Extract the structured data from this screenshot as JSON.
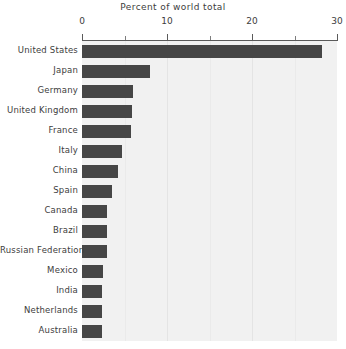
{
  "chart_data": {
    "type": "bar",
    "orientation": "horizontal",
    "title": "Percent of world total",
    "xlabel": "",
    "ylabel": "",
    "xlim": [
      0,
      30
    ],
    "xticks": [
      0,
      10,
      20,
      30
    ],
    "xtick_labels": [
      "0",
      "10",
      "20",
      "30"
    ],
    "minor_xticks": [
      5,
      15,
      25
    ],
    "grid": true,
    "grid_axis": "x",
    "legend": false,
    "bar_color": "#464646",
    "plot_background": "#f1f1f1",
    "categories": [
      "United States",
      "Japan",
      "Germany",
      "United Kingdom",
      "France",
      "Italy",
      "China",
      "Spain",
      "Canada",
      "Brazil",
      "Russian Federation",
      "Mexico",
      "India",
      "Netherlands",
      "Australia"
    ],
    "values": [
      28.2,
      8.0,
      6.0,
      5.9,
      5.8,
      4.7,
      4.2,
      3.5,
      2.9,
      2.9,
      2.9,
      2.5,
      2.3,
      2.3,
      2.3
    ]
  }
}
